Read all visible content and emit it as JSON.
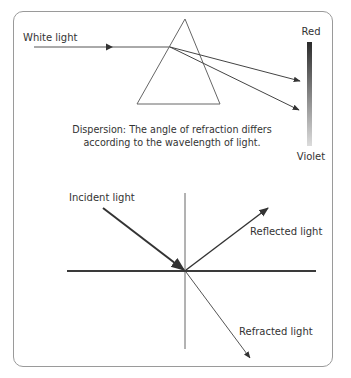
{
  "dispersion": {
    "input_label": "White light",
    "spectrum_top_label": "Red",
    "spectrum_bottom_label": "Violet",
    "caption_line1": "Dispersion: The angle of refraction differs",
    "caption_line2": "according to the wavelength of light.",
    "colors": {
      "spectrum_top": "#2b2b2b",
      "spectrum_bottom": "#d8d8d8",
      "line": "#555555"
    }
  },
  "reflection_refraction": {
    "incident_label": "Incident light",
    "reflected_label": "Reflected light",
    "refracted_label": "Refracted light",
    "colors": {
      "surface": "#3a3a3a",
      "normal": "#444444",
      "incident": "#333333",
      "reflected": "#333333",
      "refracted": "#555555"
    }
  }
}
